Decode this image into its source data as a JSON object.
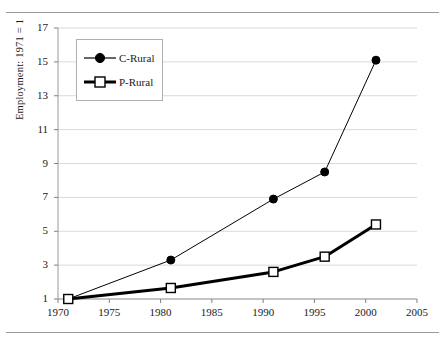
{
  "figure": {
    "title_partial": "",
    "width": 445,
    "height": 349,
    "background": "#ffffff",
    "rule_color": "#9a9a9a"
  },
  "chart_data": {
    "type": "line",
    "title": "",
    "xlabel": "",
    "ylabel": "Employment: 1971 = 1",
    "xlim": [
      1970,
      2005
    ],
    "ylim": [
      1,
      17
    ],
    "xticks": [
      1970,
      1975,
      1980,
      1985,
      1990,
      1995,
      2000,
      2005
    ],
    "xtick_labels": [
      "1970",
      "1975",
      "1980",
      "1985",
      "1990",
      "1995",
      "2000",
      "2005"
    ],
    "yticks": [
      1,
      3,
      5,
      7,
      9,
      11,
      13,
      15,
      17
    ],
    "ytick_labels": [
      "1",
      "3",
      "5",
      "7",
      "9",
      "11",
      "13",
      "15",
      "17"
    ],
    "grid": "horizontal",
    "grid_color": "#d9d9d9",
    "axis_color": "#808080",
    "legend_position": "upper-left-inside",
    "x": [
      1971,
      1981,
      1991,
      1996,
      2001
    ],
    "series": [
      {
        "name": "C-Rural",
        "values": [
          1.0,
          3.3,
          6.9,
          8.5,
          15.1
        ],
        "marker": "filled-circle",
        "marker_size": 8,
        "line_width": 1,
        "color": "#000000"
      },
      {
        "name": "P-Rural",
        "values": [
          1.0,
          1.65,
          2.6,
          3.5,
          5.4
        ],
        "marker": "open-square",
        "marker_size": 9,
        "line_width": 3,
        "color": "#000000"
      }
    ]
  },
  "legend": {
    "entries": [
      {
        "label": "C-Rural",
        "marker": "filled-circle"
      },
      {
        "label": "P-Rural",
        "marker": "open-square"
      }
    ]
  }
}
